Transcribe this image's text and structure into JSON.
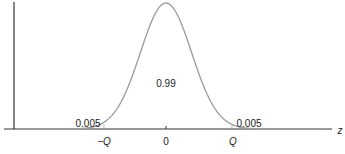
{
  "chart_data": {
    "type": "area",
    "title": "",
    "xlabel": "z",
    "ylabel": "",
    "x_ticks": [
      "-Q",
      "0",
      "Q"
    ],
    "regions": [
      {
        "name": "left-tail",
        "from": "-inf",
        "to": "-Q",
        "area_label": "0.005",
        "area": 0.005
      },
      {
        "name": "center",
        "from": "-Q",
        "to": "Q",
        "area_label": "0.99",
        "area": 0.99
      },
      {
        "name": "right-tail",
        "from": "Q",
        "to": "inf",
        "area_label": "0.005",
        "area": 0.005
      }
    ],
    "curve": {
      "distribution": "standard-normal",
      "mean": 0,
      "sd": 1,
      "q_value_approx": 2.576
    },
    "grid": false,
    "legend": "none"
  },
  "labels": {
    "center_area": "0.99",
    "left_tail": "0.005",
    "right_tail": "0.005",
    "tick_neg_q": "−Q",
    "tick_zero": "0",
    "tick_q": "Q",
    "axis_z": "z"
  },
  "colors": {
    "curve": "#9a9a9a",
    "axis": "#222222",
    "boundary": "#aaaaaa"
  }
}
